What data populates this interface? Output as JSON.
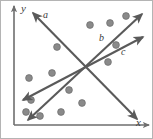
{
  "figure": {
    "width": 153,
    "height": 139,
    "background": "#ffffff",
    "border_color": "#b4b4b4",
    "stroke_color": "#5a5a5a",
    "axis_color": "#6e6e6e",
    "dot_color": "#8a8a8a",
    "dot_stroke": "#6b6b6b",
    "label_color": "#3b3b3b"
  },
  "axes": {
    "x_label": "x",
    "y_label": "y",
    "x_label_pos": {
      "x": 136,
      "y": 117
    },
    "y_label_pos": {
      "x": 21,
      "y": 3
    },
    "x_axis": {
      "x1": 14,
      "y1": 125,
      "x2": 149,
      "y2": 125
    },
    "y_axis": {
      "x1": 14,
      "y1": 125,
      "x2": 14,
      "y2": 6
    }
  },
  "lines": [
    {
      "id": "a",
      "label": "a",
      "label_pos": {
        "x": 43,
        "y": 10
      },
      "x1": 33,
      "y1": 13,
      "x2": 137,
      "y2": 119
    },
    {
      "id": "b",
      "label": "b",
      "label_pos": {
        "x": 99,
        "y": 33
      },
      "x1": 28,
      "y1": 120,
      "x2": 142,
      "y2": 14
    },
    {
      "id": "c",
      "label": "c",
      "label_pos": {
        "x": 121,
        "y": 47
      },
      "x1": 23,
      "y1": 100,
      "x2": 143,
      "y2": 37
    }
  ],
  "dots": [
    {
      "x": 57,
      "y": 47
    },
    {
      "x": 90,
      "y": 25
    },
    {
      "x": 110,
      "y": 23
    },
    {
      "x": 126,
      "y": 16
    },
    {
      "x": 116,
      "y": 45
    },
    {
      "x": 108,
      "y": 62
    },
    {
      "x": 52,
      "y": 73
    },
    {
      "x": 29,
      "y": 78
    },
    {
      "x": 69,
      "y": 90
    },
    {
      "x": 82,
      "y": 103
    },
    {
      "x": 61,
      "y": 112
    },
    {
      "x": 31,
      "y": 100
    },
    {
      "x": 40,
      "y": 116
    },
    {
      "x": 26,
      "y": 112
    }
  ],
  "chart_data": {
    "type": "scatter",
    "title": "",
    "xlabel": "x",
    "ylabel": "y",
    "grid": false,
    "legend": "none",
    "points": [
      [
        57,
        47
      ],
      [
        90,
        25
      ],
      [
        110,
        23
      ],
      [
        126,
        16
      ],
      [
        116,
        45
      ],
      [
        108,
        62
      ],
      [
        52,
        73
      ],
      [
        29,
        78
      ],
      [
        69,
        90
      ],
      [
        82,
        103
      ],
      [
        61,
        112
      ],
      [
        31,
        100
      ],
      [
        40,
        116
      ],
      [
        26,
        112
      ]
    ],
    "series": [
      {
        "name": "a",
        "type": "line",
        "direction": "negative-slope"
      },
      {
        "name": "b",
        "type": "line",
        "direction": "positive-slope-steep"
      },
      {
        "name": "c",
        "type": "line",
        "direction": "positive-slope-shallow"
      }
    ]
  }
}
